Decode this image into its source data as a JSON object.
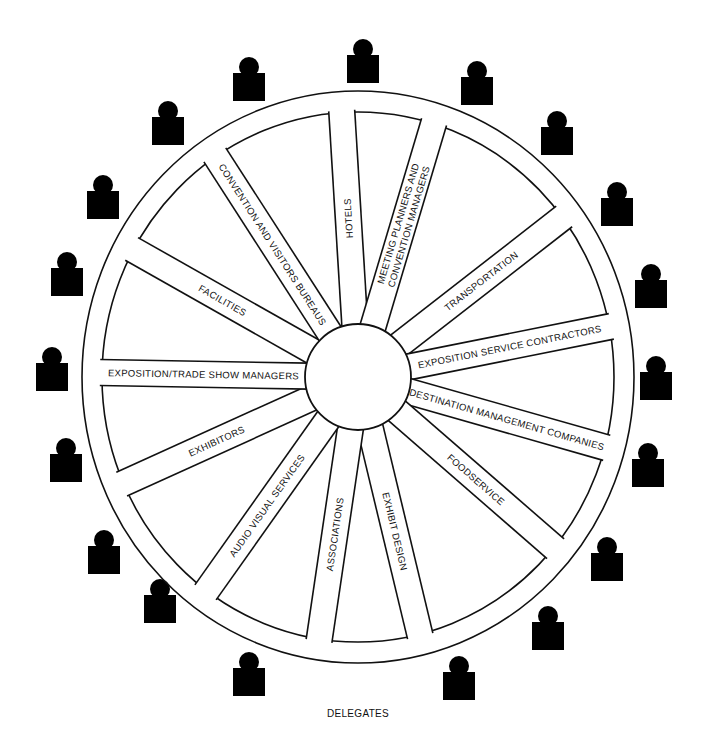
{
  "diagram": {
    "geometry": {
      "center": [
        358,
        377
      ],
      "outer_ring": {
        "rx": 276,
        "ry": 286
      },
      "inner_ring": {
        "rx": 256,
        "ry": 265
      },
      "hub_radius": 53,
      "spoke_width": 26
    },
    "colors": {
      "line": "#111111",
      "fill": "#ffffff",
      "person": "#000000"
    },
    "spokes": [
      {
        "label": "HOTELS",
        "angle": -93.5,
        "text_rotation": -93.5
      },
      {
        "label": "MEETING PLANNERS AND CONVENTION MANAGERS",
        "line1": "MEETING PLANNERS AND",
        "line2": "CONVENTION MANAGERS",
        "angle": -73.4,
        "text_rotation": -73.4
      },
      {
        "label": "TRANSPORTATION",
        "angle": -37.9,
        "text_rotation": -37.9
      },
      {
        "label": "EXPOSITION SERVICE CONTRACTORS",
        "angle": -11.3,
        "text_rotation": -11.3
      },
      {
        "label": "DESTINATION MANAGEMENT COMPANIES",
        "angle": 15.9,
        "text_rotation": 15.9
      },
      {
        "label": "FOODSERVICE",
        "angle": 41,
        "text_rotation": 41
      },
      {
        "label": "EXHIBIT DESIGN",
        "angle": 76.5,
        "text_rotation": 76.5
      },
      {
        "label": "ASSOCIATIONS",
        "angle": 98.4,
        "text_rotation": -81.6
      },
      {
        "label": "AUDIO VISUAL SERVICES",
        "angle": 125.3,
        "text_rotation": -54.7
      },
      {
        "label": "EXHIBITORS",
        "angle": 155.6,
        "text_rotation": -24.4
      },
      {
        "label": "EXPOSITION/TRADE SHOW MANAGERS",
        "angle": 181,
        "text_rotation": 1
      },
      {
        "label": "FACILITIES",
        "angle": 209.5,
        "text_rotation": 29.5
      },
      {
        "label": "CONVENTION AND VISITORS BUREAUS",
        "angle": 237.2,
        "text_rotation": 57.2
      }
    ],
    "people_icon": "person-icon",
    "people": [
      [
        347,
        55
      ],
      [
        461,
        77
      ],
      [
        541,
        127
      ],
      [
        601,
        198
      ],
      [
        635,
        280
      ],
      [
        640,
        372
      ],
      [
        632,
        459
      ],
      [
        591,
        553
      ],
      [
        532,
        622
      ],
      [
        443,
        672
      ],
      [
        233,
        668
      ],
      [
        144,
        595
      ],
      [
        88,
        546
      ],
      [
        50,
        454
      ],
      [
        36,
        363
      ],
      [
        51,
        268
      ],
      [
        87,
        191
      ],
      [
        152,
        117
      ],
      [
        233,
        73
      ]
    ],
    "caption": "DELEGATES"
  }
}
